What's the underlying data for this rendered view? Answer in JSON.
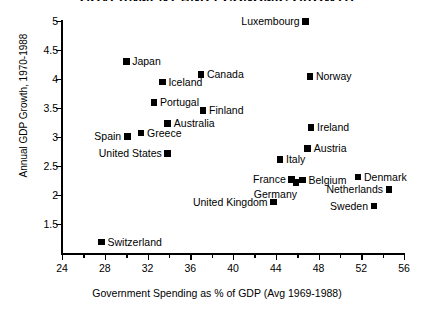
{
  "chart_data": {
    "type": "scatter",
    "title": "GOVERNMENT AND ECONOMIC GROWTH",
    "xlabel": "Government Spending as % of GDP (Avg 1969-1988)",
    "ylabel": "Annual GDP Growth, 1970-1988",
    "xlim": [
      24,
      56
    ],
    "ylim": [
      1.0,
      5.0
    ],
    "xticks": [
      24,
      28,
      32,
      36,
      40,
      44,
      48,
      52,
      56
    ],
    "xtick_labels": [
      "24",
      "28",
      "32",
      "36",
      "40",
      "44",
      "48",
      "52",
      "56"
    ],
    "xminor_ticks": [
      26,
      30,
      34,
      38,
      42,
      46,
      50,
      54
    ],
    "yticks": [
      1.5,
      2,
      2.5,
      3,
      3.5,
      4,
      4.5,
      5
    ],
    "ytick_labels": [
      "1.5",
      "2",
      "2.5",
      "3",
      "3.5",
      "4",
      "4.5",
      "5"
    ],
    "grid": false,
    "legend": "none",
    "marker": "filled-square",
    "marker_color": "#000000",
    "points": [
      {
        "label": "Luxembourg",
        "x": 46.8,
        "y": 4.99,
        "label_pos": "left"
      },
      {
        "label": "Japan",
        "x": 30.0,
        "y": 4.3,
        "label_pos": "right"
      },
      {
        "label": "Canada",
        "x": 37.0,
        "y": 4.08,
        "label_pos": "right"
      },
      {
        "label": "Norway",
        "x": 47.2,
        "y": 4.04,
        "label_pos": "right"
      },
      {
        "label": "Iceland",
        "x": 33.4,
        "y": 3.95,
        "label_pos": "right"
      },
      {
        "label": "Portugal",
        "x": 32.6,
        "y": 3.6,
        "label_pos": "right"
      },
      {
        "label": "Finland",
        "x": 37.2,
        "y": 3.46,
        "label_pos": "right"
      },
      {
        "label": "Australia",
        "x": 33.9,
        "y": 3.23,
        "label_pos": "right"
      },
      {
        "label": "Ireland",
        "x": 47.3,
        "y": 3.17,
        "label_pos": "right"
      },
      {
        "label": "Greece",
        "x": 31.4,
        "y": 3.07,
        "label_pos": "right"
      },
      {
        "label": "Spain",
        "x": 30.1,
        "y": 3.01,
        "label_pos": "left"
      },
      {
        "label": "Austria",
        "x": 47.0,
        "y": 2.8,
        "label_pos": "right"
      },
      {
        "label": "United States",
        "x": 33.9,
        "y": 2.72,
        "label_pos": "left"
      },
      {
        "label": "Italy",
        "x": 44.4,
        "y": 2.61,
        "label_pos": "right"
      },
      {
        "label": "Denmark",
        "x": 51.7,
        "y": 2.31,
        "label_pos": "right"
      },
      {
        "label": "France",
        "x": 45.5,
        "y": 2.27,
        "label_pos": "left"
      },
      {
        "label": "Belgium",
        "x": 46.5,
        "y": 2.26,
        "label_pos": "right"
      },
      {
        "label": "Germany",
        "x": 45.9,
        "y": 2.21,
        "label_pos": "below-left"
      },
      {
        "label": "Netherlands",
        "x": 54.6,
        "y": 2.1,
        "label_pos": "left"
      },
      {
        "label": "United Kingdom",
        "x": 43.8,
        "y": 1.88,
        "label_pos": "left"
      },
      {
        "label": "Sweden",
        "x": 53.2,
        "y": 1.81,
        "label_pos": "left"
      },
      {
        "label": "Switzerland",
        "x": 27.7,
        "y": 1.19,
        "label_pos": "right"
      }
    ]
  }
}
